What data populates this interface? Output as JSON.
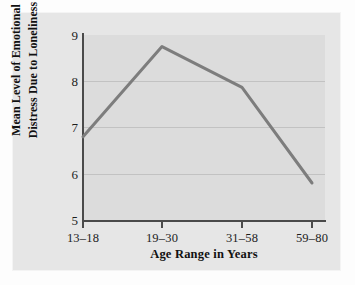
{
  "chart_data": {
    "type": "line",
    "title": "",
    "xlabel": "Age Range in Years",
    "ylabel": "Mean Level of Emotional Distress Due to Loneliness",
    "ylabel_lines": [
      "Mean Level of Emotional",
      "Distress Due to Loneliness"
    ],
    "categories": [
      "13–18",
      "19–30",
      "31–58",
      "59–80"
    ],
    "values": [
      6.8,
      8.75,
      7.87,
      5.8
    ],
    "series": [
      {
        "name": "Mean emotional distress",
        "values": [
          6.8,
          8.75,
          7.87,
          5.8
        ]
      }
    ],
    "ylim": [
      5,
      9
    ],
    "yticks": [
      "9",
      "8",
      "7",
      "6",
      "5"
    ],
    "ytick_values": [
      9,
      8,
      7,
      6,
      5
    ],
    "gridlines": [
      8,
      7,
      6
    ],
    "grid": true,
    "legend": "none",
    "line_color": "#7d7d7d",
    "plot_background": "#dcdcdc",
    "card_background": "#e6e6e6",
    "axis_color": "#4a4a4a",
    "grid_color": "#c2c2c2"
  },
  "axes": {
    "y_ticks": [
      {
        "label": "9",
        "value": 9
      },
      {
        "label": "8",
        "value": 8
      },
      {
        "label": "7",
        "value": 7
      },
      {
        "label": "6",
        "value": 6
      },
      {
        "label": "5",
        "value": 5
      }
    ],
    "x_ticks": [
      {
        "label": "13–18",
        "value": 6.8
      },
      {
        "label": "19–30",
        "value": 8.75
      },
      {
        "label": "31–58",
        "value": 7.87
      },
      {
        "label": "59–80",
        "value": 5.8
      }
    ]
  }
}
